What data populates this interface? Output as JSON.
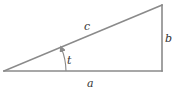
{
  "diagram": {
    "type": "right-triangle",
    "colors": {
      "line": "#8a8a8a",
      "label": "#333333",
      "background": "#ffffff"
    },
    "vertices": {
      "left": [
        4,
        71
      ],
      "right_bottom": [
        162,
        71
      ],
      "top": [
        162,
        5
      ]
    },
    "labels": {
      "hypotenuse": "c",
      "vertical_side": "b",
      "horizontal_side": "a",
      "angle": "t"
    }
  }
}
